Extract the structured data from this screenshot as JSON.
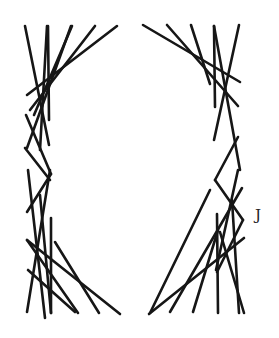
{
  "figure": {
    "label": "J",
    "stroke_color": "#161616",
    "background": "#ffffff",
    "lines": [
      [
        25,
        26,
        49,
        145
      ],
      [
        47,
        26,
        40,
        150
      ],
      [
        48,
        26,
        49,
        120
      ],
      [
        71,
        26,
        27,
        148
      ],
      [
        72,
        26,
        34,
        115
      ],
      [
        95,
        26,
        30,
        110
      ],
      [
        117,
        26,
        27,
        95
      ],
      [
        26,
        115,
        51,
        174
      ],
      [
        51,
        174,
        27,
        212
      ],
      [
        25,
        148,
        50,
        180
      ],
      [
        28,
        170,
        45,
        318
      ],
      [
        50,
        170,
        27,
        312
      ],
      [
        40,
        195,
        51,
        313
      ],
      [
        51,
        218,
        51,
        313
      ],
      [
        27,
        240,
        78,
        313
      ],
      [
        28,
        270,
        75,
        312
      ],
      [
        55,
        242,
        99,
        313
      ],
      [
        27,
        240,
        120,
        314
      ],
      [
        143,
        25,
        240,
        82
      ],
      [
        167,
        25,
        238,
        106
      ],
      [
        191,
        25,
        210,
        84
      ],
      [
        214,
        26,
        215,
        107
      ],
      [
        214,
        26,
        240,
        170
      ],
      [
        239,
        25,
        214,
        140
      ],
      [
        238,
        137,
        215,
        180
      ],
      [
        215,
        180,
        243,
        220
      ],
      [
        243,
        220,
        217,
        272
      ],
      [
        238,
        170,
        216,
        270
      ],
      [
        242,
        188,
        170,
        312
      ],
      [
        210,
        190,
        150,
        313
      ],
      [
        244,
        238,
        149,
        314
      ],
      [
        218,
        230,
        193,
        312
      ],
      [
        217,
        214,
        218,
        313
      ],
      [
        220,
        232,
        244,
        313
      ],
      [
        232,
        200,
        239,
        313
      ]
    ]
  }
}
